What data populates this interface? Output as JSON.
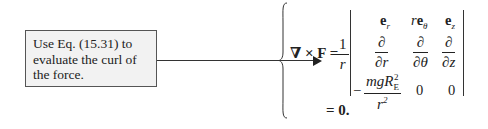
{
  "note": {
    "text": "Use Eq. (15.31) to evaluate the curl of the force."
  },
  "equation": {
    "lhs": "∇ × F =",
    "prefactor": {
      "num": "1",
      "den": "r"
    },
    "matrix": {
      "row1": [
        "e_r",
        "r e_θ",
        "e_z"
      ],
      "row2": [
        "∂/∂r",
        "∂/∂θ",
        "∂/∂z"
      ],
      "row3": [
        "−mgR_E²/r²",
        "0",
        "0"
      ]
    },
    "result": "= 0."
  },
  "labels": {
    "row3_neg": "−",
    "row3_num": "mgR",
    "row3_sub": "E",
    "row3_sup": "2",
    "row3_den": "r",
    "row3_densup": "2",
    "zero1": "0",
    "zero2": "0",
    "partial": "∂",
    "dr": "∂r",
    "dtheta": "∂θ",
    "dz": "∂z",
    "one": "1",
    "r": "r",
    "result": "= 0."
  }
}
